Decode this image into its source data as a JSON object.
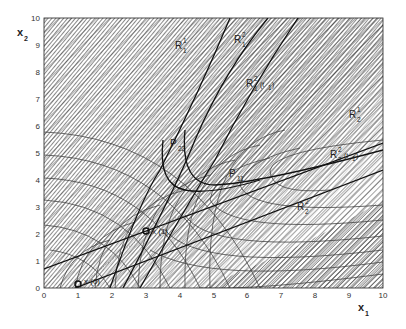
{
  "figure": {
    "xaxis": {
      "label": "x",
      "label_sub": "1",
      "min": 0,
      "max": 10,
      "ticks": [
        "0",
        "1",
        "2",
        "3",
        "4",
        "5",
        "6",
        "7",
        "8",
        "9",
        "10"
      ]
    },
    "yaxis": {
      "label": "x",
      "label_sub": "2",
      "min": 0,
      "max": 10,
      "ticks": [
        "0",
        "1",
        "2",
        "3",
        "4",
        "5",
        "6",
        "7",
        "8",
        "9",
        "10"
      ]
    },
    "labels": {
      "R11": {
        "main": "R",
        "sub": "1",
        "sup": "1"
      },
      "R12": {
        "main": "R",
        "sub": "1",
        "sup": "2"
      },
      "R12x": {
        "main": "R",
        "sub": "1",
        "sup": "2",
        "arg": "(t",
        "arg_sub": "1",
        "arg_close": ")"
      },
      "R21": {
        "main": "R",
        "sub": "2",
        "sup": "1"
      },
      "R22x": {
        "main": "R",
        "sub": "2",
        "sup": "2",
        "arg": "(t",
        "arg_sub": "1",
        "arg_close": ")"
      },
      "R22": {
        "main": "R",
        "sub": "2",
        "sup": "2"
      },
      "P22": {
        "main": "P",
        "sub": "22"
      },
      "P11": {
        "main": "P",
        "sub": "11"
      },
      "x1pt": {
        "text": "x (1)"
      },
      "x0pt": {
        "text": "x (0)"
      }
    },
    "points": [
      {
        "name": "x(0)",
        "x1": 1.0,
        "x2": 0.15
      },
      {
        "name": "x(1)",
        "x1": 3.0,
        "x2": 2.1
      }
    ]
  },
  "colors": {
    "line": "#1a1a1a",
    "hatch": "#3a3a3a",
    "contour": "#444444",
    "background": "#ffffff"
  }
}
